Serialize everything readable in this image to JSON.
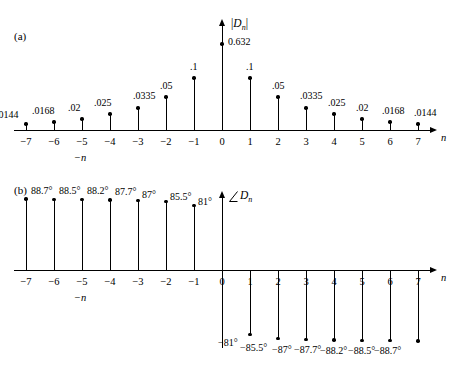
{
  "figure": {
    "panel_a_tag": "(a)",
    "panel_b_tag": "(b)",
    "neg_n_label_a": "−n",
    "neg_n_label_b": "−n",
    "axis_name_a": "n",
    "axis_name_b": "n",
    "ylabel_a_text": "|Dn|",
    "ylabel_b_text": "∠Dn"
  },
  "chart_data": [
    {
      "type": "stem",
      "id": "magnitude-spectrum",
      "title": "(a)",
      "xlabel": "n",
      "ylabel": "|Dn|",
      "secondary_xlabel": "−n",
      "grid": false,
      "legend": false,
      "x": [
        -7,
        -6,
        -5,
        -4,
        -3,
        -2,
        -1,
        0,
        1,
        2,
        3,
        4,
        5,
        6,
        7
      ],
      "xtick_labels": [
        "−7",
        "−6",
        "−5",
        "−4",
        "−3",
        "−2",
        "−1",
        "0",
        "1",
        "2",
        "3",
        "4",
        "5",
        "6",
        "7"
      ],
      "values": [
        0.0144,
        0.0168,
        0.02,
        0.025,
        0.0335,
        0.05,
        0.1,
        0.632,
        0.1,
        0.05,
        0.0335,
        0.025,
        0.02,
        0.0168,
        0.0144
      ],
      "value_labels": [
        ".0144",
        ".0168",
        ".02",
        ".025",
        ".0335",
        ".05",
        ".1",
        "0.632",
        ".1",
        ".05",
        ".0335",
        ".025",
        ".02",
        ".0168",
        ".0144"
      ],
      "pixel_heights": [
        6,
        8,
        11,
        16,
        22,
        33,
        52,
        86,
        52,
        33,
        22,
        16,
        11,
        8,
        6
      ],
      "ylim": [
        0,
        0.7
      ]
    },
    {
      "type": "stem",
      "id": "phase-spectrum",
      "title": "(b)",
      "xlabel": "n",
      "ylabel": "∠Dn",
      "secondary_xlabel": "−n",
      "grid": false,
      "legend": false,
      "units": "degrees",
      "x": [
        -7,
        -6,
        -5,
        -4,
        -3,
        -2,
        -1,
        1,
        2,
        3,
        4,
        5,
        6,
        7
      ],
      "xtick_labels": [
        "−7",
        "−6",
        "−5",
        "−4",
        "−3",
        "−2",
        "−1",
        "0",
        "1",
        "2",
        "3",
        "4",
        "5",
        "6",
        "7"
      ],
      "values": [
        88.7,
        88.5,
        88.2,
        87.7,
        87.0,
        85.5,
        81.0,
        -81.0,
        -85.5,
        -87.0,
        -87.7,
        -88.2,
        -88.5,
        -88.7
      ],
      "value_labels": [
        "88.7°",
        "88.5°",
        "88.2°",
        "87.7°",
        "87°",
        "85.5°",
        "81°",
        "−81°",
        "−85.5°",
        "−87°",
        "−87.7°",
        "−88.2°",
        "−88.5°",
        "−88.7°"
      ],
      "ylim": [
        -95,
        95
      ]
    }
  ]
}
